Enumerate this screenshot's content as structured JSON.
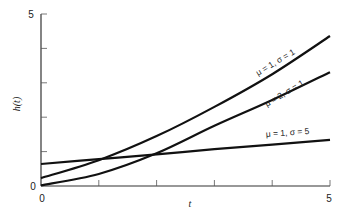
{
  "chart_data": {
    "type": "line",
    "title": "",
    "xlabel": "t",
    "ylabel": "h(t)",
    "xlim": [
      0,
      5
    ],
    "ylim": [
      0,
      5
    ],
    "x_tick_labels": [
      "0",
      "5"
    ],
    "y_tick_labels": [
      "0",
      "5"
    ],
    "x_ticks": [
      0,
      1,
      2,
      3,
      4,
      5
    ],
    "y_ticks": [
      0,
      1,
      2,
      3,
      4,
      5
    ],
    "grid": false,
    "legend": "inline labels on curves",
    "x": [
      0,
      1,
      2,
      3,
      4,
      5
    ],
    "series": [
      {
        "name": "μ = 1, σ = 1",
        "values": [
          0.23,
          0.75,
          1.45,
          2.3,
          3.25,
          4.36
        ]
      },
      {
        "name": "μ = 2, σ = 1",
        "values": [
          0.02,
          0.35,
          0.95,
          1.75,
          2.5,
          3.31
        ]
      },
      {
        "name": "μ = 1, σ = 5",
        "values": [
          0.64,
          0.78,
          0.92,
          1.07,
          1.2,
          1.34
        ]
      }
    ]
  },
  "labels": {
    "y_max": "5",
    "y_min": "0",
    "x_min": "0",
    "x_max": "5",
    "xlabel": "t",
    "ylabel": "h(t)",
    "curve1": "μ = 1, σ = 1",
    "curve2": "μ = 2, σ = 1",
    "curve3": "μ = 1, σ = 5"
  }
}
